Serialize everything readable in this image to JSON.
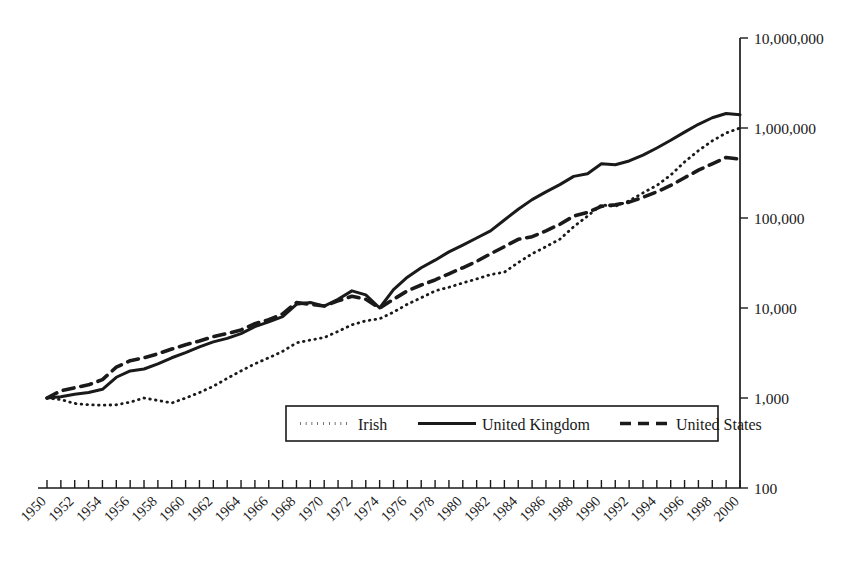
{
  "chart_data": {
    "type": "line",
    "title": "",
    "subtitle": "",
    "xlabel": "",
    "ylabel": "",
    "yscale": "log",
    "ylim": [
      100,
      10000000
    ],
    "xlim": [
      1950,
      2000
    ],
    "grid": false,
    "legend_position": "bottom-center",
    "y_ticks": [
      100,
      1000,
      10000,
      100000,
      1000000,
      10000000
    ],
    "y_tick_labels": [
      "100",
      "1,000",
      "10,000",
      "100,000",
      "1,000,000",
      "10,000,000"
    ],
    "x_tick_labels": [
      "1950",
      "1952",
      "1954",
      "1956",
      "1958",
      "1960",
      "1962",
      "1964",
      "1966",
      "1968",
      "1970",
      "1972",
      "1974",
      "1976",
      "1978",
      "1980",
      "1982",
      "1984",
      "1986",
      "1988",
      "1990",
      "1992",
      "1994",
      "1996",
      "1998",
      "2000"
    ],
    "x_minor_ticks_every": 1,
    "x": [
      1950,
      1951,
      1952,
      1953,
      1954,
      1955,
      1956,
      1957,
      1958,
      1959,
      1960,
      1961,
      1962,
      1963,
      1964,
      1965,
      1966,
      1967,
      1968,
      1969,
      1970,
      1971,
      1972,
      1973,
      1974,
      1975,
      1976,
      1977,
      1978,
      1979,
      1980,
      1981,
      1982,
      1983,
      1984,
      1985,
      1986,
      1987,
      1988,
      1989,
      1990,
      1991,
      1992,
      1993,
      1994,
      1995,
      1996,
      1997,
      1998,
      1999,
      2000
    ],
    "series": [
      {
        "name": "Irish",
        "style": "dotted",
        "values": [
          1000,
          960,
          870,
          840,
          830,
          840,
          900,
          1000,
          940,
          880,
          1000,
          1150,
          1350,
          1650,
          2000,
          2400,
          2800,
          3300,
          4100,
          4400,
          4700,
          5500,
          6500,
          7200,
          7600,
          9000,
          11000,
          13000,
          15500,
          17000,
          19000,
          21000,
          23500,
          25000,
          32000,
          40000,
          48000,
          58000,
          80000,
          105000,
          140000,
          135000,
          155000,
          190000,
          230000,
          300000,
          420000,
          560000,
          720000,
          880000,
          1000000
        ]
      },
      {
        "name": "United Kingdom",
        "style": "solid",
        "values": [
          1000,
          1030,
          1100,
          1150,
          1250,
          1700,
          2000,
          2100,
          2400,
          2800,
          3200,
          3700,
          4200,
          4600,
          5200,
          6200,
          7000,
          8000,
          11000,
          11500,
          10500,
          12500,
          15500,
          14000,
          10000,
          16000,
          22000,
          28000,
          34000,
          42000,
          50000,
          60000,
          72000,
          95000,
          125000,
          160000,
          195000,
          235000,
          290000,
          310000,
          400000,
          390000,
          430000,
          500000,
          600000,
          730000,
          900000,
          1100000,
          1300000,
          1450000,
          1400000
        ]
      },
      {
        "name": "United States",
        "style": "dashed",
        "values": [
          1000,
          1200,
          1300,
          1400,
          1600,
          2200,
          2600,
          2800,
          3100,
          3500,
          3900,
          4300,
          4800,
          5200,
          5700,
          6700,
          7400,
          8600,
          11500,
          11000,
          10500,
          12000,
          13500,
          12500,
          10000,
          12500,
          15500,
          18000,
          20500,
          24000,
          28000,
          33000,
          40000,
          48000,
          58000,
          62000,
          72000,
          85000,
          105000,
          115000,
          135000,
          140000,
          150000,
          170000,
          195000,
          230000,
          280000,
          340000,
          400000,
          470000,
          450000
        ]
      }
    ],
    "legend": [
      {
        "label": "Irish",
        "style": "dotted"
      },
      {
        "label": "United Kingdom",
        "style": "solid"
      },
      {
        "label": "United States",
        "style": "dashed"
      }
    ],
    "colors": {
      "ink": "#1a1a1a",
      "background": "#ffffff"
    }
  }
}
